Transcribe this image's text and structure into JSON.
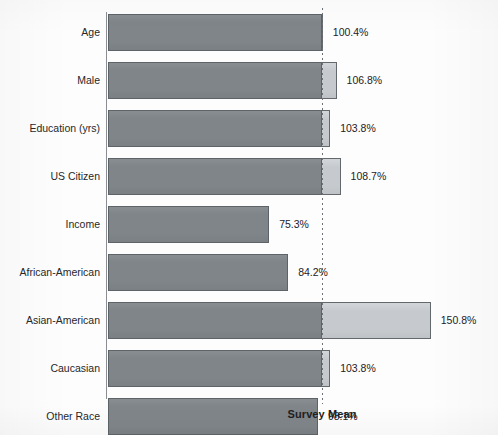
{
  "chart_data": {
    "type": "bar",
    "orientation": "horizontal",
    "title": "",
    "subtitle": "",
    "xlabel": "",
    "ylabel": "",
    "grid": false,
    "legend": null,
    "categories": [
      "Age",
      "Male",
      "Education (yrs)",
      "US Citizen",
      "Income",
      "African-American",
      "Asian-American",
      "Caucasian",
      "Other Race"
    ],
    "values": [
      100.4,
      106.8,
      103.8,
      108.7,
      75.3,
      84.2,
      150.8,
      103.8,
      98.1
    ],
    "value_labels": [
      "100.4%",
      "106.8%",
      "103.8%",
      "108.7%",
      "75.3%",
      "84.2%",
      "150.8%",
      "103.8%",
      "98.1%"
    ],
    "unit": "%",
    "xlim": [
      0,
      160
    ],
    "reference_line": {
      "label": "Survey Mean",
      "value": 100,
      "style": "dotted"
    },
    "colors": {
      "bar_below_reference": "#80858a",
      "bar_above_reference": "#c6cace",
      "bar_outline": "#5e6367",
      "reference_line": "#6e7175",
      "text": "#1f2124",
      "background": "#fdfdfd"
    }
  },
  "geometry": {
    "origin_x": 108,
    "reference_x": 322,
    "px_per_100pct": 214,
    "first_bar_top": 14,
    "bar_height": 37,
    "bar_pitch": 48,
    "axis_top": 12,
    "axis_bottom": 399
  }
}
